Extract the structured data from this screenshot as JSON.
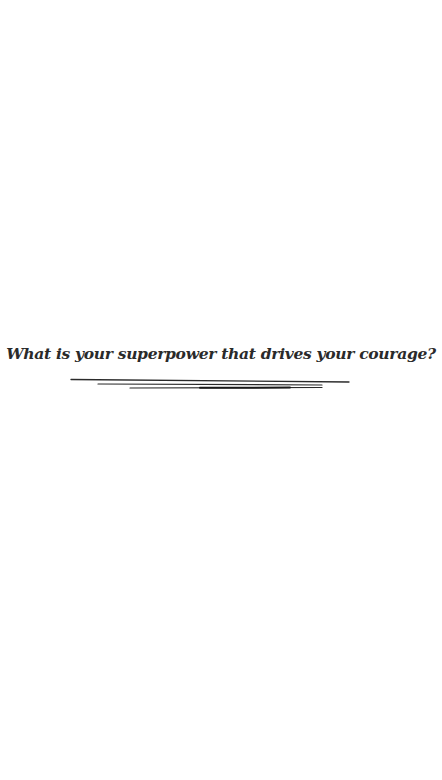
{
  "prompt": {
    "text": "What is your superpower that drives your courage?"
  },
  "colors": {
    "background": "#ffffff",
    "text": "#2a2a2a",
    "lines": "#2a2a2a"
  },
  "decoration": {
    "type": "hand-drawn underline strokes",
    "count": 3
  }
}
